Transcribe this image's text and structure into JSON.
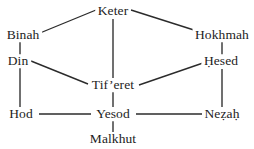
{
  "diagram": {
    "type": "node-link-diagram",
    "colors": {
      "background": "#ffffff",
      "line": "#2b2b2b",
      "text": "#1d1d1d"
    },
    "nodes": [
      {
        "id": "keter",
        "label": "Keter",
        "x": 113,
        "y": 11
      },
      {
        "id": "binah",
        "label": "Binah",
        "x": 23,
        "y": 35
      },
      {
        "id": "hokhmah",
        "label": "Hokhmah",
        "x": 222,
        "y": 35
      },
      {
        "id": "din",
        "label": "Din",
        "x": 18,
        "y": 61
      },
      {
        "id": "hesed",
        "label": "Ḥesed",
        "x": 221,
        "y": 61
      },
      {
        "id": "tiferet",
        "label": "Tif’eret",
        "x": 113,
        "y": 85
      },
      {
        "id": "hod",
        "label": "Hod",
        "x": 21,
        "y": 114
      },
      {
        "id": "yesod",
        "label": "Yesod",
        "x": 113,
        "y": 114
      },
      {
        "id": "nezah",
        "label": "Neẓaḥ",
        "x": 222,
        "y": 114
      },
      {
        "id": "malkhut",
        "label": "Malkhut",
        "x": 113,
        "y": 139
      }
    ],
    "edges": [
      {
        "id": "binah-keter",
        "from": "binah",
        "to": "keter",
        "x1": 40,
        "y1": 33,
        "x2": 96,
        "y2": 10
      },
      {
        "id": "keter-hokhmah",
        "from": "keter",
        "to": "hokhmah",
        "x1": 131,
        "y1": 10,
        "x2": 197,
        "y2": 31
      },
      {
        "id": "keter-tiferet",
        "from": "keter",
        "to": "tiferet",
        "x1": 113,
        "y1": 19,
        "x2": 113,
        "y2": 78
      },
      {
        "id": "binah-din",
        "from": "binah",
        "to": "din",
        "x1": 20,
        "y1": 42,
        "x2": 20,
        "y2": 55
      },
      {
        "id": "hokhmah-hesed",
        "from": "hokhmah",
        "to": "hesed",
        "x1": 222,
        "y1": 42,
        "x2": 222,
        "y2": 55
      },
      {
        "id": "din-tiferet",
        "from": "din",
        "to": "tiferet",
        "x1": 31,
        "y1": 61,
        "x2": 88,
        "y2": 84
      },
      {
        "id": "tiferet-hesed",
        "from": "tiferet",
        "to": "hesed",
        "x1": 139,
        "y1": 85,
        "x2": 203,
        "y2": 63
      },
      {
        "id": "din-hod",
        "from": "din",
        "to": "hod",
        "x1": 20,
        "y1": 68,
        "x2": 20,
        "y2": 107
      },
      {
        "id": "hesed-nezah",
        "from": "hesed",
        "to": "nezah",
        "x1": 222,
        "y1": 69,
        "x2": 222,
        "y2": 107
      },
      {
        "id": "tiferet-yesod",
        "from": "tiferet",
        "to": "yesod",
        "x1": 113,
        "y1": 92,
        "x2": 113,
        "y2": 107
      },
      {
        "id": "hod-yesod",
        "from": "hod",
        "to": "yesod",
        "x1": 39,
        "y1": 114,
        "x2": 91,
        "y2": 114
      },
      {
        "id": "yesod-nezah",
        "from": "yesod",
        "to": "nezah",
        "x1": 136,
        "y1": 114,
        "x2": 202,
        "y2": 114
      },
      {
        "id": "yesod-malkhut",
        "from": "yesod",
        "to": "malkhut",
        "x1": 113,
        "y1": 121,
        "x2": 113,
        "y2": 132
      }
    ]
  }
}
